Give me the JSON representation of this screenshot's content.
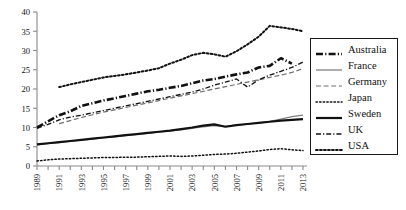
{
  "chart_data": {
    "type": "line",
    "title": "",
    "subtitle": "",
    "xlabel": "",
    "ylabel": "",
    "xlim": [
      1989,
      2013
    ],
    "ylim": [
      0,
      40
    ],
    "yticks": [
      0,
      5,
      10,
      15,
      20,
      25,
      30,
      35,
      40
    ],
    "ytick_labels": [
      "0",
      "5",
      "10",
      "15",
      "20",
      "25",
      "30",
      "35",
      "40"
    ],
    "xticks": [
      1989,
      1990,
      1991,
      1992,
      1993,
      1994,
      1995,
      1996,
      1997,
      1998,
      1999,
      2000,
      2001,
      2002,
      2003,
      2004,
      2005,
      2006,
      2007,
      2008,
      2009,
      2010,
      2011,
      2012,
      2013
    ],
    "xtick_labels": [
      "1989",
      "",
      "1991",
      "",
      "1993",
      "",
      "1995",
      "",
      "1997",
      "",
      "1999",
      "",
      "2001",
      "",
      "2003",
      "",
      "2005",
      "",
      "2007",
      "",
      "2009",
      "",
      "2011",
      "",
      "2013"
    ],
    "xtick_label_rotation": 90,
    "grid": false,
    "legend_position": "right",
    "x": [
      1989,
      1990,
      1991,
      1992,
      1993,
      1994,
      1995,
      1996,
      1997,
      1998,
      1999,
      2000,
      2001,
      2002,
      2003,
      2004,
      2005,
      2006,
      2007,
      2008,
      2009,
      2010,
      2011,
      2012,
      2013
    ],
    "series": [
      {
        "name": "Australia",
        "style": "thick-dash-dot",
        "color": "#111111",
        "x": [
          1989,
          1990,
          1991,
          1992,
          1993,
          1994,
          1995,
          1996,
          1997,
          1998,
          1999,
          2000,
          2001,
          2002,
          2003,
          2004,
          2005,
          2006,
          2007,
          2008,
          2009,
          2010,
          2011,
          2012
        ],
        "values": [
          10.0,
          11.6,
          13.2,
          14.2,
          15.6,
          16.3,
          17.0,
          17.6,
          18.2,
          18.8,
          19.4,
          19.8,
          20.3,
          20.8,
          21.5,
          22.2,
          22.6,
          23.2,
          23.8,
          24.3,
          25.6,
          26.0,
          28.0,
          26.6
        ]
      },
      {
        "name": "France",
        "style": "thin-solid",
        "color": "#808080",
        "x": [
          1989,
          1990,
          1991,
          1992,
          1993,
          1994,
          1995,
          1996,
          1997,
          1998,
          1999,
          2000,
          2001,
          2002,
          2003,
          2004,
          2005,
          2006,
          2007,
          2008,
          2009,
          2010,
          2011,
          2012,
          2013
        ],
        "values": [
          5.5,
          5.8,
          6.1,
          6.4,
          6.7,
          7.0,
          7.3,
          7.6,
          7.9,
          8.2,
          8.5,
          8.8,
          9.1,
          9.4,
          9.8,
          10.2,
          10.5,
          10.3,
          10.6,
          10.9,
          11.2,
          11.6,
          12.2,
          12.8,
          13.2
        ]
      },
      {
        "name": "Germany",
        "style": "dashed",
        "color": "#6e6e6e",
        "x": [
          1991,
          1992,
          1993,
          1994,
          1995,
          1996,
          1997,
          1998,
          1999,
          2000,
          2001,
          2002,
          2003,
          2004,
          2005,
          2006,
          2007,
          2008,
          2009,
          2010,
          2011,
          2012,
          2013
        ],
        "values": [
          11.0,
          11.8,
          12.6,
          13.3,
          14.0,
          14.6,
          15.2,
          15.8,
          16.4,
          17.0,
          17.6,
          18.2,
          18.8,
          19.4,
          20.0,
          20.6,
          21.2,
          21.8,
          22.4,
          23.0,
          23.6,
          24.3,
          25.3
        ]
      },
      {
        "name": "Japan",
        "style": "fine-dotted",
        "color": "#111111",
        "x": [
          1989,
          1990,
          1991,
          1992,
          1993,
          1994,
          1995,
          1996,
          1997,
          1998,
          1999,
          2000,
          2001,
          2002,
          2003,
          2004,
          2005,
          2006,
          2007,
          2008,
          2009,
          2010,
          2011,
          2012,
          2013
        ],
        "values": [
          1.3,
          1.6,
          1.8,
          1.9,
          2.0,
          2.1,
          2.2,
          2.2,
          2.3,
          2.3,
          2.4,
          2.5,
          2.6,
          2.5,
          2.6,
          2.8,
          3.0,
          3.1,
          3.3,
          3.6,
          3.9,
          4.3,
          4.5,
          4.2,
          4.0
        ]
      },
      {
        "name": "Sweden",
        "style": "thick-solid",
        "color": "#111111",
        "x": [
          1989,
          1990,
          1991,
          1992,
          1993,
          1994,
          1995,
          1996,
          1997,
          1998,
          1999,
          2000,
          2001,
          2002,
          2003,
          2004,
          2005,
          2006,
          2007,
          2008,
          2009,
          2010,
          2011,
          2012,
          2013
        ],
        "values": [
          5.6,
          5.9,
          6.2,
          6.5,
          6.8,
          7.1,
          7.4,
          7.7,
          8.0,
          8.3,
          8.6,
          8.9,
          9.2,
          9.6,
          10.0,
          10.5,
          10.8,
          10.2,
          10.6,
          10.9,
          11.2,
          11.5,
          11.8,
          12.0,
          12.2
        ]
      },
      {
        "name": "UK",
        "style": "dash-dot",
        "color": "#111111",
        "x": [
          1989,
          1990,
          1991,
          1992,
          1993,
          1994,
          1995,
          1996,
          1997,
          1998,
          1999,
          2000,
          2001,
          2002,
          2003,
          2004,
          2005,
          2006,
          2007,
          2008,
          2009,
          2010,
          2011,
          2012,
          2013
        ],
        "values": [
          9.8,
          10.8,
          12.0,
          12.7,
          13.2,
          13.8,
          14.4,
          15.0,
          15.6,
          16.2,
          16.8,
          17.4,
          18.0,
          18.6,
          19.2,
          20.0,
          21.0,
          21.8,
          22.6,
          20.5,
          22.4,
          23.6,
          24.6,
          25.6,
          27.0
        ]
      },
      {
        "name": "USA",
        "style": "bold-dotted",
        "color": "#111111",
        "x": [
          1991,
          1992,
          1993,
          1994,
          1995,
          1996,
          1997,
          1998,
          1999,
          2000,
          2001,
          2002,
          2003,
          2004,
          2005,
          2006,
          2007,
          2008,
          2009,
          2010,
          2011,
          2012,
          2013
        ],
        "values": [
          20.5,
          21.2,
          21.8,
          22.4,
          23.0,
          23.4,
          23.8,
          24.3,
          24.8,
          25.4,
          26.6,
          27.6,
          28.8,
          29.4,
          29.0,
          28.4,
          29.8,
          31.6,
          33.6,
          36.4,
          36.0,
          35.6,
          35.0
        ]
      }
    ]
  },
  "legend": {
    "entries": [
      {
        "label": "Australia"
      },
      {
        "label": "France"
      },
      {
        "label": "Germany"
      },
      {
        "label": "Japan"
      },
      {
        "label": "Sweden"
      },
      {
        "label": "UK"
      },
      {
        "label": "USA"
      }
    ]
  }
}
